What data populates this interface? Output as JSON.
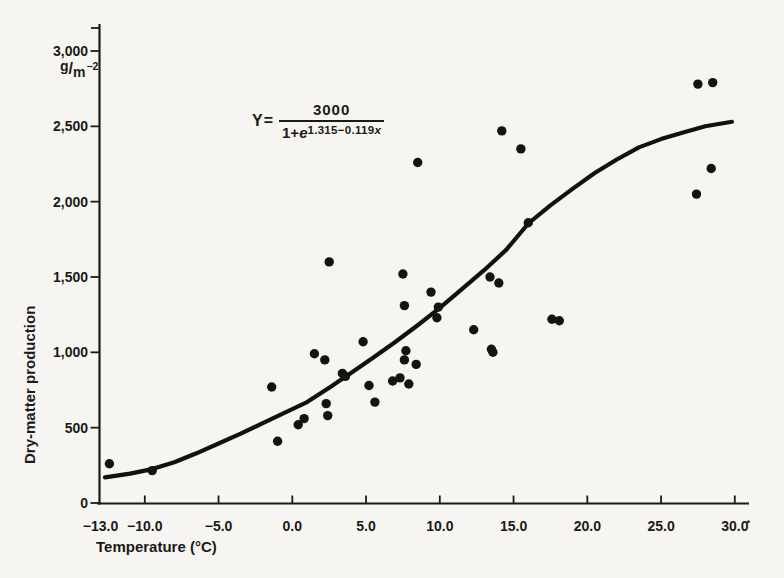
{
  "page": {
    "background": "#f6f5f1",
    "ink": "#1c1a17"
  },
  "chart_data": {
    "type": "scatter",
    "title": "",
    "xlabel": "Temperature (°C)",
    "ylabel": "Dry-matter production",
    "y_unit": {
      "base": "g",
      "slash": "/",
      "denom": "m",
      "exp": "−2"
    },
    "equation": {
      "lhs": "Y",
      "equals": "=",
      "numerator": "3000",
      "den_prefix": "1+",
      "den_e": "e",
      "exp_coeff": "1.315−0.119",
      "exp_var": "x"
    },
    "x_axis": {
      "min": -13.2,
      "max": 30.8,
      "ticks": [
        {
          "value": -13,
          "label": "−13.0",
          "has_tick": false
        },
        {
          "value": -10,
          "label": "−10.0",
          "has_tick": true
        },
        {
          "value": -5,
          "label": "−5.0",
          "has_tick": true
        },
        {
          "value": 0,
          "label": "0.0",
          "has_tick": true
        },
        {
          "value": 5,
          "label": "5.0",
          "has_tick": true
        },
        {
          "value": 10,
          "label": "10.0",
          "has_tick": true
        },
        {
          "value": 15,
          "label": "15.0",
          "has_tick": true
        },
        {
          "value": 20,
          "label": "20.0",
          "has_tick": true
        },
        {
          "value": 25,
          "label": "25.0",
          "has_tick": true
        },
        {
          "value": 30,
          "label": "30.0",
          "has_tick": true
        }
      ],
      "trailing_mark": "."
    },
    "y_axis": {
      "min": 0,
      "max": 3150,
      "ticks": [
        {
          "value": 0,
          "label": "0"
        },
        {
          "value": 500,
          "label": "500"
        },
        {
          "value": 1000,
          "label": "1,000"
        },
        {
          "value": 1500,
          "label": "1,500"
        },
        {
          "value": 2000,
          "label": "2,000"
        },
        {
          "value": 2500,
          "label": "2,500"
        },
        {
          "value": 3000,
          "label": "3,000"
        }
      ]
    },
    "points": [
      [
        -12.4,
        260
      ],
      [
        -9.5,
        215
      ],
      [
        -1.4,
        770
      ],
      [
        -1.0,
        410
      ],
      [
        0.4,
        520
      ],
      [
        0.8,
        560
      ],
      [
        1.5,
        990
      ],
      [
        2.2,
        950
      ],
      [
        2.3,
        660
      ],
      [
        2.4,
        580
      ],
      [
        2.5,
        1600
      ],
      [
        3.4,
        860
      ],
      [
        3.6,
        840
      ],
      [
        4.8,
        1070
      ],
      [
        5.2,
        780
      ],
      [
        5.6,
        670
      ],
      [
        6.8,
        810
      ],
      [
        7.3,
        830
      ],
      [
        7.5,
        1520
      ],
      [
        7.6,
        1310
      ],
      [
        7.6,
        950
      ],
      [
        7.7,
        1010
      ],
      [
        7.9,
        790
      ],
      [
        8.4,
        920
      ],
      [
        8.5,
        2260
      ],
      [
        9.4,
        1400
      ],
      [
        9.8,
        1230
      ],
      [
        9.9,
        1300
      ],
      [
        12.3,
        1150
      ],
      [
        13.4,
        1500
      ],
      [
        13.5,
        1020
      ],
      [
        13.6,
        1000
      ],
      [
        14.0,
        1460
      ],
      [
        14.2,
        2470
      ],
      [
        15.5,
        2350
      ],
      [
        16.0,
        1860
      ],
      [
        17.6,
        1220
      ],
      [
        18.1,
        1210
      ],
      [
        27.4,
        2050
      ],
      [
        27.5,
        2780
      ],
      [
        28.4,
        2220
      ],
      [
        28.5,
        2790
      ]
    ],
    "curve_points": [
      [
        -12.7,
        170
      ],
      [
        -11,
        195
      ],
      [
        -9.5,
        225
      ],
      [
        -8,
        270
      ],
      [
        -6.5,
        330
      ],
      [
        -5,
        395
      ],
      [
        -3.5,
        460
      ],
      [
        -2,
        530
      ],
      [
        -0.5,
        600
      ],
      [
        1,
        670
      ],
      [
        2.5,
        765
      ],
      [
        4,
        865
      ],
      [
        5.5,
        965
      ],
      [
        7,
        1070
      ],
      [
        8.5,
        1180
      ],
      [
        10,
        1295
      ],
      [
        11.5,
        1420
      ],
      [
        13,
        1545
      ],
      [
        14.5,
        1680
      ],
      [
        16,
        1855
      ],
      [
        17.5,
        1975
      ],
      [
        19,
        2085
      ],
      [
        20.5,
        2190
      ],
      [
        22,
        2280
      ],
      [
        23.5,
        2360
      ],
      [
        25,
        2415
      ],
      [
        26.5,
        2460
      ],
      [
        28,
        2500
      ],
      [
        29.3,
        2522
      ],
      [
        29.8,
        2530
      ]
    ]
  }
}
